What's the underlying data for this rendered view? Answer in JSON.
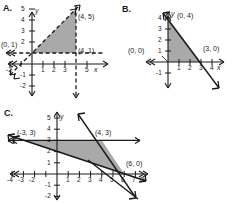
{
  "figure": {
    "fill_color": "#a9a9a9",
    "line_color": "#1a1a1a",
    "background": "#ffffff"
  },
  "panels": [
    {
      "label": "A.",
      "axis_x_name": "x",
      "axis_y_name": "y",
      "x_ticks": [
        "-2",
        "1",
        "2",
        "3",
        "5"
      ],
      "y_ticks": [
        "5",
        "4",
        "3",
        "2",
        "-1",
        "-2"
      ],
      "point_labels": [
        "(4, 5)",
        "(4, 1)",
        "(0, 1)"
      ],
      "vertices": [
        [
          0,
          1
        ],
        [
          4,
          1
        ],
        [
          4,
          5
        ]
      ],
      "line_style": "dashed",
      "boundary_lines": [
        {
          "name": "horizontal-boundary",
          "style": "dashed",
          "description": "y = 1"
        },
        {
          "name": "vertical-boundary",
          "style": "dashed",
          "description": "x = 4"
        },
        {
          "name": "diagonal-boundary",
          "style": "dashed",
          "description": "y = x + 1"
        }
      ]
    },
    {
      "label": "B.",
      "axis_x_name": "x",
      "axis_y_name": "y",
      "x_ticks": [
        "1",
        "2",
        "3",
        "4"
      ],
      "y_ticks": [
        "4",
        "3",
        "2",
        "1",
        "-1"
      ],
      "point_labels": [
        "(0, 4)",
        "(3, 0)",
        "(0, 0)"
      ],
      "vertices": [
        [
          0,
          0
        ],
        [
          3,
          0
        ],
        [
          0,
          4
        ]
      ],
      "line_style": "solid",
      "boundary_lines": [
        {
          "name": "diagonal-boundary",
          "style": "solid",
          "description": "4x + 3y = 12"
        },
        {
          "name": "y-axis-boundary",
          "style": "solid",
          "description": "x = 0"
        },
        {
          "name": "x-axis-boundary",
          "style": "solid",
          "description": "y = 0"
        }
      ]
    },
    {
      "label": "C.",
      "axis_x_name": "x",
      "axis_y_name": "y",
      "x_ticks": [
        "-4",
        "-3",
        "-2",
        "1",
        "2",
        "3",
        "4",
        "5",
        "6",
        "7",
        "8"
      ],
      "y_ticks": [
        "5",
        "4",
        "3",
        "2",
        "1",
        "-1",
        "-2"
      ],
      "point_labels": [
        "(-3, 3)",
        "(4, 3)",
        "(6, 0)"
      ],
      "vertices": [
        [
          -3,
          3
        ],
        [
          4,
          3
        ],
        [
          6,
          0
        ]
      ],
      "line_style": "solid",
      "boundary_lines": [
        {
          "name": "horizontal-boundary",
          "style": "solid",
          "description": "y = 3"
        },
        {
          "name": "steep-boundary",
          "style": "solid",
          "description": "through (4, 3) and (6, 0)"
        },
        {
          "name": "shallow-boundary",
          "style": "solid",
          "description": "through (-3, 3) and (6, 0)"
        }
      ]
    }
  ]
}
